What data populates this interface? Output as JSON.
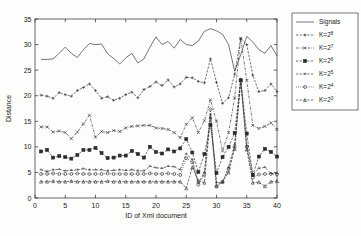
{
  "chart_data": {
    "type": "line",
    "title": "",
    "xlabel": "ID of Xml document",
    "ylabel": "Distance",
    "xlim": [
      0,
      40
    ],
    "ylim": [
      0,
      35
    ],
    "xticks": [
      0,
      5,
      10,
      15,
      20,
      25,
      30,
      35,
      40
    ],
    "yticks": [
      0,
      5,
      10,
      15,
      20,
      25,
      30,
      35
    ],
    "grid": false,
    "legend_position": "right-outside",
    "legend_entries": [
      "Signals",
      "K=2^8",
      "K=2^7",
      "K=2^6",
      "K=2^5",
      "K=2^4",
      "K=2^3"
    ],
    "x": [
      1,
      2,
      3,
      4,
      5,
      6,
      7,
      8,
      9,
      10,
      11,
      12,
      13,
      14,
      15,
      16,
      17,
      18,
      19,
      20,
      21,
      22,
      23,
      24,
      25,
      26,
      27,
      28,
      29,
      30,
      31,
      32,
      33,
      34,
      35,
      36,
      37,
      38,
      39,
      40
    ],
    "series": [
      {
        "name": "Signals",
        "marker": "none",
        "linestyle": "solid",
        "color": "#2b2b2b",
        "values": [
          27.1,
          27.1,
          27.2,
          28.3,
          29.5,
          28.3,
          27.5,
          29.0,
          30.2,
          30.0,
          30.1,
          28.2,
          27.3,
          26.2,
          27.4,
          28.3,
          26.4,
          27.2,
          29.5,
          31.5,
          30.0,
          30.6,
          29.3,
          31.0,
          30.0,
          29.8,
          30.7,
          32.6,
          33.1,
          32.7,
          32.0,
          30.0,
          24.8,
          28.0,
          31.6,
          30.5,
          29.0,
          28.3,
          29.8,
          27.8
        ]
      },
      {
        "name": "K=2^8",
        "marker": "plus",
        "linestyle": "dashed",
        "color": "#2b2b2b",
        "values": [
          20.1,
          19.9,
          19.5,
          20.6,
          20.2,
          19.9,
          21.0,
          21.6,
          22.3,
          21.0,
          19.5,
          19.8,
          19.1,
          19.5,
          20.2,
          20.7,
          19.6,
          21.2,
          21.8,
          22.7,
          22.0,
          23.1,
          21.7,
          22.3,
          23.6,
          23.5,
          22.8,
          22.5,
          27.2,
          22.6,
          18.5,
          19.6,
          24.2,
          31.2,
          30.0,
          24.0,
          20.8,
          21.0,
          22.3,
          20.8
        ]
      },
      {
        "name": "K=2^7",
        "marker": "x",
        "linestyle": "dashdot",
        "color": "#2b2b2b",
        "values": [
          13.9,
          13.9,
          12.9,
          13.1,
          12.8,
          11.6,
          12.9,
          14.5,
          16.2,
          11.9,
          13.0,
          12.8,
          13.2,
          13.0,
          13.7,
          14.0,
          14.1,
          14.2,
          14.2,
          13.7,
          13.6,
          13.4,
          12.8,
          11.8,
          14.4,
          15.7,
          12.8,
          15.1,
          19.2,
          15.0,
          9.2,
          12.8,
          19.6,
          31.2,
          23.0,
          14.2,
          13.6,
          14.0,
          14.7,
          13.4
        ]
      },
      {
        "name": "K=2^6",
        "marker": "square",
        "linestyle": "dashed",
        "color": "#2b2b2b",
        "values": [
          9.1,
          9.4,
          7.9,
          8.2,
          8.0,
          7.7,
          8.4,
          9.4,
          9.4,
          9.8,
          8.8,
          7.8,
          7.9,
          8.3,
          8.3,
          9.2,
          8.6,
          7.9,
          10.0,
          9.0,
          8.7,
          9.5,
          9.1,
          9.7,
          11.5,
          8.9,
          5.1,
          8.6,
          14.3,
          4.9,
          8.0,
          10.0,
          12.7,
          23.0,
          12.6,
          4.5,
          8.1,
          9.6,
          9.0,
          8.1
        ]
      },
      {
        "name": "K=2^5",
        "marker": "caret",
        "linestyle": "dashed",
        "color": "#2b2b2b",
        "values": [
          5.5,
          5.2,
          5.5,
          5.6,
          5.3,
          5.4,
          5.5,
          5.7,
          5.5,
          5.5,
          5.5,
          5.3,
          5.4,
          5.5,
          5.4,
          5.5,
          5.3,
          5.3,
          6.2,
          5.9,
          5.8,
          6.2,
          6.1,
          5.5,
          8.6,
          7.5,
          2.9,
          5.0,
          16.3,
          3.0,
          3.0,
          6.0,
          10.4,
          23.2,
          10.2,
          4.6,
          5.8,
          6.0,
          4.8,
          4.8
        ]
      },
      {
        "name": "K=2^4",
        "marker": "circle",
        "linestyle": "dotted",
        "color": "#2b2b2b",
        "values": [
          4.7,
          4.7,
          4.8,
          4.7,
          4.7,
          4.7,
          4.8,
          4.7,
          4.7,
          4.7,
          4.7,
          4.8,
          4.7,
          4.7,
          4.7,
          4.7,
          4.7,
          4.7,
          4.8,
          4.7,
          4.7,
          4.8,
          4.7,
          4.5,
          7.8,
          7.0,
          2.6,
          4.6,
          17.3,
          2.3,
          3.2,
          5.7,
          10.0,
          23.1,
          10.0,
          4.0,
          4.6,
          4.7,
          4.7,
          4.6
        ]
      },
      {
        "name": "K=2^3",
        "marker": "triangle",
        "linestyle": "dashed",
        "color": "#2b2b2b",
        "values": [
          3.2,
          3.2,
          3.3,
          3.2,
          3.2,
          3.3,
          3.2,
          3.2,
          3.2,
          3.2,
          3.2,
          3.3,
          3.2,
          3.2,
          3.2,
          3.2,
          3.2,
          3.2,
          3.2,
          3.2,
          3.2,
          3.2,
          3.2,
          3.2,
          1.9,
          6.0,
          3.4,
          3.0,
          15.8,
          2.3,
          3.2,
          5.0,
          9.6,
          23.0,
          9.5,
          3.0,
          3.1,
          2.3,
          3.2,
          3.3
        ]
      }
    ]
  },
  "axes": {
    "xlabel": "ID of Xml document",
    "ylabel": "Distance"
  }
}
